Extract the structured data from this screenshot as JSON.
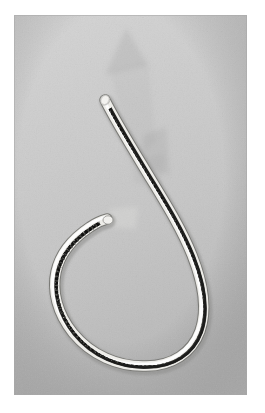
{
  "figure": {
    "domain_label": "Natural-Image",
    "kind": "photograph",
    "color_mode": "grayscale",
    "caption": "",
    "overlay_text": ""
  },
  "canvas": {
    "width": 265,
    "height": 413,
    "page_background": "#ffffff"
  },
  "photo": {
    "x": 14,
    "y": 15,
    "width": 233,
    "height": 380,
    "background_top": "#d2d2d2",
    "background_mid": "#c9c9c9",
    "background_bottom": "#bcbcbc",
    "vignette_color": "#a9a9a9",
    "grain_opacity": 0.22
  },
  "specimen": {
    "name": "worm-body",
    "description": "elongated looped nematode specimen forming an open hook",
    "sheath_color": "#f0efec",
    "sheath_highlight": "#fdfdfb",
    "cuticle_shadow": "#8d8d8a",
    "gut_color": "#2a2a28",
    "gut_speckle_color": "#141413",
    "body_width_px": 9,
    "gut_width_px": 3,
    "anterior_tip": {
      "x": 105,
      "y": 100
    },
    "posterior_tip": {
      "x": 105,
      "y": 219
    },
    "path_points": [
      {
        "x": 105,
        "y": 100
      },
      {
        "x": 122,
        "y": 131
      },
      {
        "x": 143,
        "y": 166
      },
      {
        "x": 166,
        "y": 205
      },
      {
        "x": 186,
        "y": 243
      },
      {
        "x": 200,
        "y": 278
      },
      {
        "x": 205,
        "y": 309
      },
      {
        "x": 196,
        "y": 336
      },
      {
        "x": 175,
        "y": 355
      },
      {
        "x": 146,
        "y": 366
      },
      {
        "x": 114,
        "y": 365
      },
      {
        "x": 85,
        "y": 351
      },
      {
        "x": 65,
        "y": 327
      },
      {
        "x": 55,
        "y": 297
      },
      {
        "x": 54,
        "y": 268
      },
      {
        "x": 60,
        "y": 244
      },
      {
        "x": 73,
        "y": 228
      },
      {
        "x": 90,
        "y": 220
      },
      {
        "x": 105,
        "y": 219
      }
    ]
  },
  "overlays": [
    {
      "name": "ghost-arrow-upper",
      "description": "faint translucent arrow marker pointing toward the anterior tip",
      "opacity": 0.2,
      "color": "#8f8f8f",
      "apex": {
        "x": 126,
        "y": 28
      }
    },
    {
      "name": "ghost-wedge-middle",
      "description": "faint translucent wedge shadow beside the body",
      "opacity": 0.17,
      "color": "#8a8a8a"
    },
    {
      "name": "ghost-tab-lower",
      "description": "faint translucent pale tab near the posterior tip",
      "opacity": 0.3,
      "color": "#e2e1de"
    }
  ],
  "scale_bar": {
    "visible": false,
    "label": ""
  }
}
